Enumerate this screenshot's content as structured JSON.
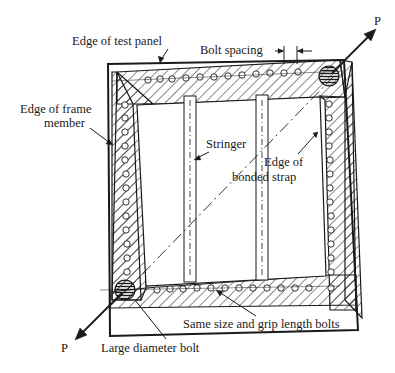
{
  "labels": {
    "edge_test_panel": "Edge of test panel",
    "bolt_spacing": "Bolt spacing",
    "edge_frame_line1": "Edge of frame",
    "edge_frame_line2": "member",
    "stringer": "Stringer",
    "bonded_strap_line1": "Edge of",
    "bonded_strap_line2": "bonded strap",
    "same_size_bolts": "Same size and grip length bolts",
    "large_bolt": "Large diameter bolt",
    "load_top": "P",
    "load_bottom": "P"
  },
  "colors": {
    "ink": "#1a1a1a",
    "background": "#ffffff"
  }
}
